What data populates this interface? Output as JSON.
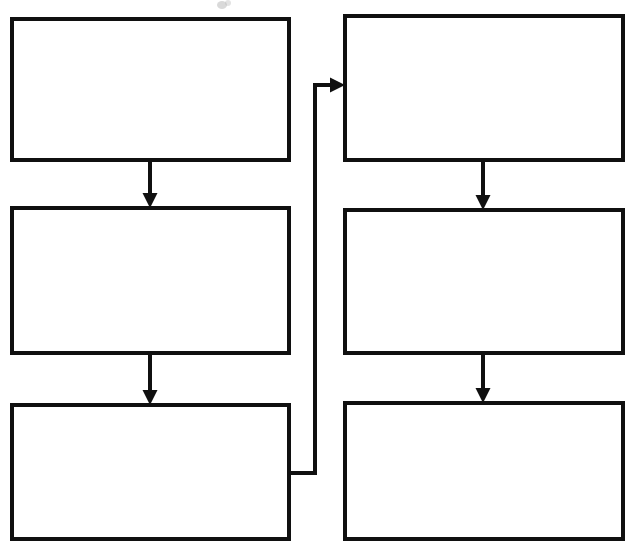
{
  "diagram": {
    "type": "flowchart",
    "title": "",
    "canvas": {
      "width": 638,
      "height": 548,
      "background": "#ffffff"
    },
    "style": {
      "box_fill": "#ffffff",
      "box_stroke": "#101010",
      "box_stroke_width": 4,
      "connector_stroke": "#101010",
      "connector_stroke_width": 4,
      "arrowhead_fill": "#101010"
    },
    "nodes": [
      {
        "id": "left-1",
        "label": "",
        "column": "left",
        "row": 1,
        "x": 12,
        "y": 19,
        "width": 277,
        "height": 141
      },
      {
        "id": "left-2",
        "label": "",
        "column": "left",
        "row": 2,
        "x": 12,
        "y": 208,
        "width": 277,
        "height": 145
      },
      {
        "id": "left-3",
        "label": "",
        "column": "left",
        "row": 3,
        "x": 12,
        "y": 405,
        "width": 277,
        "height": 134
      },
      {
        "id": "right-1",
        "label": "",
        "column": "right",
        "row": 1,
        "x": 345,
        "y": 16,
        "width": 278,
        "height": 144
      },
      {
        "id": "right-2",
        "label": "",
        "column": "right",
        "row": 2,
        "x": 345,
        "y": 210,
        "width": 278,
        "height": 143
      },
      {
        "id": "right-3",
        "label": "",
        "column": "right",
        "row": 3,
        "x": 345,
        "y": 403,
        "width": 278,
        "height": 136
      }
    ],
    "edges": [
      {
        "id": "edge-left1-left2",
        "from": "left-1",
        "to": "left-2",
        "label": "",
        "kind": "straight-down",
        "arrow": true
      },
      {
        "id": "edge-left2-left3",
        "from": "left-2",
        "to": "left-3",
        "label": "",
        "kind": "straight-down",
        "arrow": true
      },
      {
        "id": "edge-right1-right2",
        "from": "right-1",
        "to": "right-2",
        "label": "",
        "kind": "straight-down",
        "arrow": true
      },
      {
        "id": "edge-right2-right3",
        "from": "right-2",
        "to": "right-3",
        "label": "",
        "kind": "straight-down",
        "arrow": true
      },
      {
        "id": "edge-left3-right1",
        "from": "left-3",
        "to": "right-1",
        "label": "",
        "kind": "routed-feedback",
        "arrow": true
      }
    ],
    "geometry": {
      "left_arrow_x": 150,
      "right_arrow_x": 483,
      "feedback_exit_y": 473,
      "feedback_vertical_x": 315,
      "feedback_entry_y": 85,
      "arrowhead_width": 15,
      "arrowhead_height": 15
    }
  }
}
